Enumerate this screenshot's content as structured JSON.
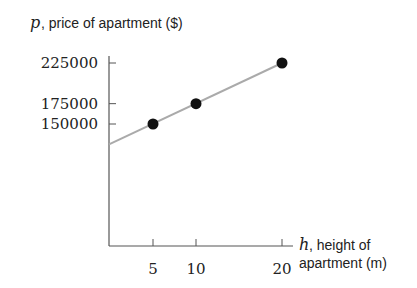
{
  "chart_data": {
    "type": "scatter",
    "title": "",
    "ylabel_var": "p",
    "ylabel_text": ", price of apartment ($)",
    "xlabel_var": "h",
    "xlabel_line1": ", height of",
    "xlabel_line2": "apartment (m)",
    "points": [
      {
        "x": 5,
        "y": 150000
      },
      {
        "x": 10,
        "y": 175000
      },
      {
        "x": 20,
        "y": 225000
      }
    ],
    "trend_line": {
      "intercept": 125000,
      "slope": 5000,
      "x_from": 0,
      "x_to": 20,
      "color": "#aaaaaa"
    },
    "x_ticks": [
      {
        "value": 5,
        "label": "5"
      },
      {
        "value": 10,
        "label": "10"
      },
      {
        "value": 20,
        "label": "20"
      }
    ],
    "y_ticks": [
      {
        "value": 150000,
        "label": "150000"
      },
      {
        "value": 175000,
        "label": "175000"
      },
      {
        "value": 225000,
        "label": "225000"
      }
    ],
    "xlim": [
      0,
      21
    ],
    "ylim": [
      0,
      240000
    ],
    "grid": false,
    "point_color": "#111111",
    "axis_color": "#555555"
  }
}
